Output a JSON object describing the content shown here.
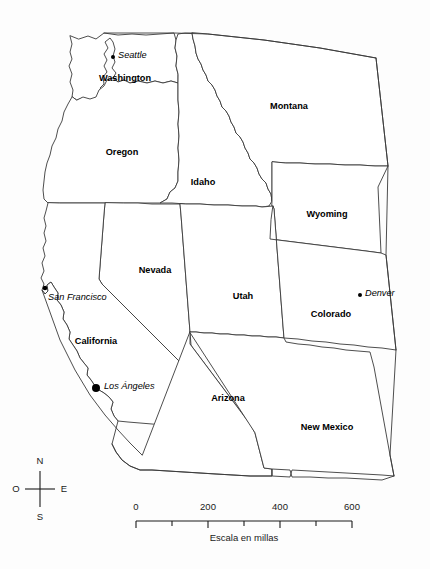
{
  "map": {
    "title": "",
    "background_color": "#fdfdfd",
    "outline_color": "#3a3a3a",
    "label_color": "#000000",
    "states": [
      {
        "id": "washington",
        "label": "Washington",
        "label_x": 125,
        "label_y": 79
      },
      {
        "id": "oregon",
        "label": "Oregon",
        "label_x": 122,
        "label_y": 153
      },
      {
        "id": "idaho",
        "label": "Idaho",
        "label_x": 203,
        "label_y": 183
      },
      {
        "id": "montana",
        "label": "Montana",
        "label_x": 289,
        "label_y": 107
      },
      {
        "id": "wyoming",
        "label": "Wyoming",
        "label_x": 327,
        "label_y": 215
      },
      {
        "id": "nevada",
        "label": "Nevada",
        "label_x": 155,
        "label_y": 271
      },
      {
        "id": "utah",
        "label": "Utah",
        "label_x": 243,
        "label_y": 297
      },
      {
        "id": "colorado",
        "label": "Colorado",
        "label_x": 331,
        "label_y": 315
      },
      {
        "id": "california",
        "label": "California",
        "label_x": 96,
        "label_y": 342
      },
      {
        "id": "arizona",
        "label": "Arizona",
        "label_x": 228,
        "label_y": 399
      },
      {
        "id": "new-mexico",
        "label": "New Mexico",
        "label_x": 327,
        "label_y": 428
      }
    ],
    "cities": [
      {
        "id": "seattle",
        "label": "Seattle",
        "dot_x": 113,
        "dot_y": 57,
        "dot_r": 2.0,
        "label_x": 118,
        "label_y": 56
      },
      {
        "id": "san-francisco",
        "label": "San Francisco",
        "dot_x": 45,
        "dot_y": 288,
        "dot_r": 2.3,
        "label_x": 48,
        "label_y": 298
      },
      {
        "id": "los-angeles",
        "label": "Los Ángeles",
        "dot_x": 96,
        "dot_y": 388,
        "dot_r": 4.0,
        "label_x": 104,
        "label_y": 387
      },
      {
        "id": "denver",
        "label": "Denver",
        "dot_x": 360,
        "dot_y": 295,
        "dot_r": 2.0,
        "label_x": 365,
        "label_y": 294
      }
    ],
    "compass": {
      "north": "N",
      "west": "O",
      "east": "E",
      "south": "S",
      "center_x": 40,
      "center_y": 489
    },
    "scale": {
      "caption": "Escala en millas",
      "ticks": [
        {
          "value": "0",
          "x": 136,
          "major": true
        },
        {
          "value": "",
          "x": 172,
          "major": false
        },
        {
          "value": "200",
          "x": 208,
          "major": true
        },
        {
          "value": "",
          "x": 244,
          "major": false
        },
        {
          "value": "400",
          "x": 280,
          "major": true
        },
        {
          "value": "",
          "x": 316,
          "major": false
        },
        {
          "value": "600",
          "x": 352,
          "major": true
        }
      ],
      "bar_y": 521,
      "label_y": 507,
      "caption_x": 244,
      "caption_y": 538
    }
  }
}
